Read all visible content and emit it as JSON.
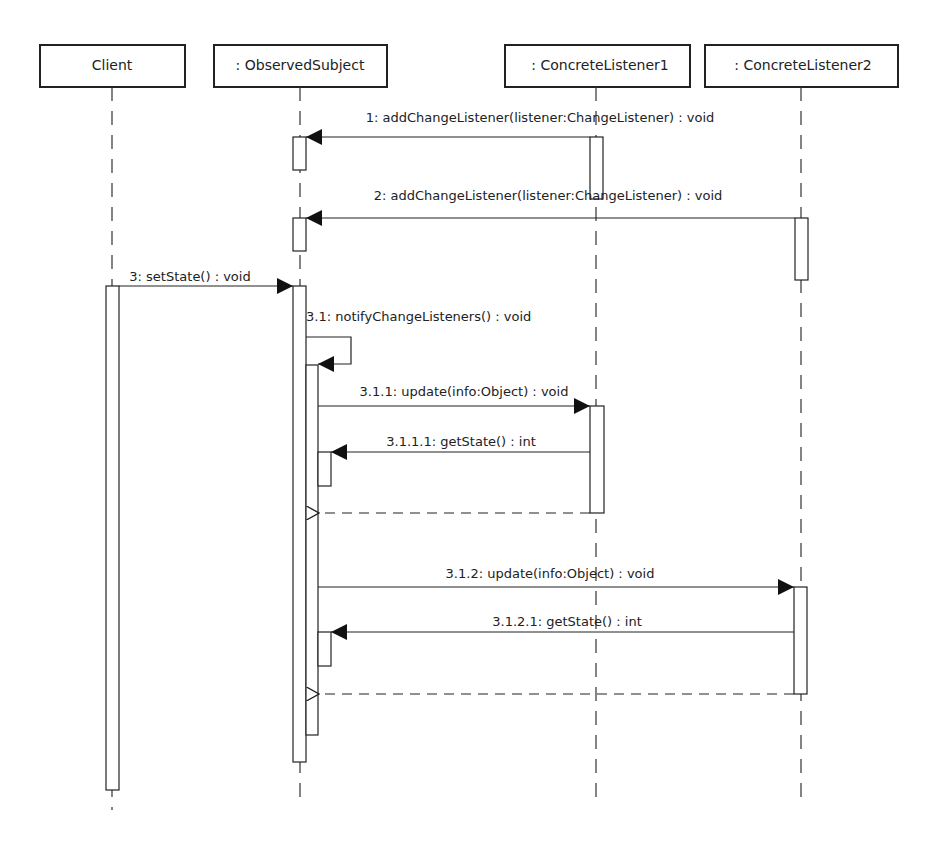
{
  "diagram": {
    "type": "uml-sequence",
    "colors": {
      "line": "#222222",
      "background": "#ffffff"
    },
    "participants": [
      {
        "id": "client",
        "label": "Client"
      },
      {
        "id": "subject",
        "label": ": ObservedSubject"
      },
      {
        "id": "l1",
        "label": ": ConcreteListener1"
      },
      {
        "id": "l2",
        "label": ": ConcreteListener2"
      }
    ],
    "messages": [
      {
        "from": "l1",
        "to": "subject",
        "kind": "sync",
        "label": "1: addChangeListener(listener:ChangeListener) : void"
      },
      {
        "from": "l2",
        "to": "subject",
        "kind": "sync",
        "label": "2: addChangeListener(listener:ChangeListener) : void"
      },
      {
        "from": "client",
        "to": "subject",
        "kind": "sync",
        "label": "3: setState() : void"
      },
      {
        "from": "subject",
        "to": "subject",
        "kind": "self",
        "label": "3.1: notifyChangeListeners() : void"
      },
      {
        "from": "subject",
        "to": "l1",
        "kind": "sync",
        "label": "3.1.1: update(info:Object) : void"
      },
      {
        "from": "l1",
        "to": "subject",
        "kind": "sync",
        "label": "3.1.1.1: getState() : int"
      },
      {
        "from": "l1",
        "to": "subject",
        "kind": "return",
        "label": ""
      },
      {
        "from": "subject",
        "to": "l2",
        "kind": "sync",
        "label": "3.1.2: update(info:Object) : void"
      },
      {
        "from": "l2",
        "to": "subject",
        "kind": "sync",
        "label": "3.1.2.1: getState() : int"
      },
      {
        "from": "l2",
        "to": "subject",
        "kind": "return",
        "label": ""
      }
    ]
  }
}
